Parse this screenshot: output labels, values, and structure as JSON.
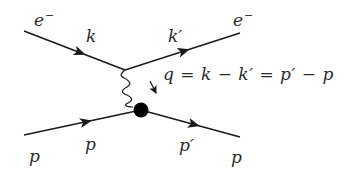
{
  "diagram": {
    "type": "feynman",
    "colors": {
      "line": "#1a1a1a",
      "text": "#2a2a2a",
      "blob": "#000000",
      "background": "#ffffff"
    },
    "labels": {
      "electron_in": {
        "symbol": "e",
        "sup": "−"
      },
      "electron_out": {
        "symbol": "e",
        "sup": "−"
      },
      "k": "k",
      "k_prime": "k′",
      "proton_in": "p",
      "p": "p",
      "p_prime": "p′",
      "proton_out": "p"
    },
    "equation": {
      "text": "q = k − k′ = p′ − p",
      "parts": [
        "q",
        "=",
        "k",
        "−",
        "k′",
        "=",
        "p′",
        "−",
        "p"
      ]
    },
    "lines": [
      {
        "name": "incoming-electron",
        "from": [
          24,
          31
        ],
        "to": [
          125,
          70
        ],
        "arrow": true
      },
      {
        "name": "outgoing-electron",
        "from": [
          125,
          70
        ],
        "to": [
          240,
          33
        ],
        "arrow": true
      },
      {
        "name": "incoming-proton",
        "from": [
          24,
          135
        ],
        "to": [
          141,
          110
        ],
        "arrow": true
      },
      {
        "name": "outgoing-proton",
        "from": [
          141,
          110
        ],
        "to": [
          240,
          137
        ],
        "arrow": true
      },
      {
        "name": "photon",
        "from": [
          125,
          70
        ],
        "to": [
          141,
          110
        ],
        "style": "wavy"
      }
    ],
    "vertex_blob": {
      "cx": 141,
      "cy": 110,
      "r": 7
    }
  }
}
